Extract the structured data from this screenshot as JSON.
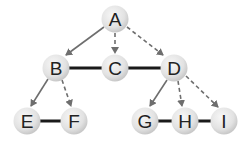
{
  "diagram": {
    "type": "graph-traversal",
    "nodes": [
      {
        "id": "A",
        "label": "A",
        "x": 115,
        "y": 19
      },
      {
        "id": "B",
        "label": "B",
        "x": 56,
        "y": 68
      },
      {
        "id": "C",
        "label": "C",
        "x": 115,
        "y": 68
      },
      {
        "id": "D",
        "label": "D",
        "x": 174,
        "y": 68
      },
      {
        "id": "E",
        "label": "E",
        "x": 27,
        "y": 121
      },
      {
        "id": "F",
        "label": "F",
        "x": 74,
        "y": 121
      },
      {
        "id": "G",
        "label": "G",
        "x": 145,
        "y": 121
      },
      {
        "id": "H",
        "label": "H",
        "x": 185,
        "y": 121
      },
      {
        "id": "I",
        "label": "I",
        "x": 224,
        "y": 121
      }
    ],
    "edges": [
      {
        "from": "A",
        "to": "B",
        "style": "solid-arrow"
      },
      {
        "from": "A",
        "to": "C",
        "style": "dashed-arrow"
      },
      {
        "from": "A",
        "to": "D",
        "style": "dashed-arrow"
      },
      {
        "from": "B",
        "to": "C",
        "style": "solid-thick"
      },
      {
        "from": "C",
        "to": "D",
        "style": "solid-thick"
      },
      {
        "from": "B",
        "to": "E",
        "style": "solid-arrow"
      },
      {
        "from": "B",
        "to": "F",
        "style": "dashed-arrow"
      },
      {
        "from": "E",
        "to": "F",
        "style": "solid-thick"
      },
      {
        "from": "D",
        "to": "G",
        "style": "solid-arrow"
      },
      {
        "from": "D",
        "to": "H",
        "style": "dashed-arrow"
      },
      {
        "from": "D",
        "to": "I",
        "style": "dashed-arrow"
      },
      {
        "from": "G",
        "to": "H",
        "style": "solid-thick"
      },
      {
        "from": "H",
        "to": "I",
        "style": "solid-thick"
      }
    ],
    "colors": {
      "node_fill_center": "#f2f2f2",
      "node_fill_edge": "#cfcfcf",
      "arrow": "#6e6e6e",
      "thick_edge": "#1a1a1a",
      "label": "#222222"
    }
  }
}
